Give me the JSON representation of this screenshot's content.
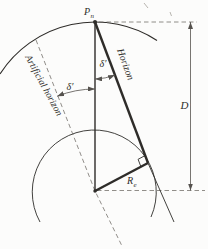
{
  "labels": {
    "pole_main": "P",
    "pole_sub": "n",
    "horizon": "Horizon",
    "artificial_horizon": "Artificial horizon",
    "dip_right": "δ′",
    "dip_left": "δ′",
    "radius_main": "R",
    "radius_sub": "e",
    "distance": "D"
  },
  "colors": {
    "line": "#2e2c29",
    "dashed": "#75716c",
    "background": "#fcfcfb"
  }
}
